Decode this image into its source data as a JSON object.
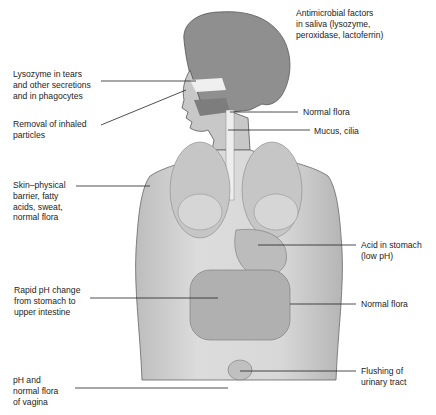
{
  "diagram": {
    "colors": {
      "background": "#ffffff",
      "figure_fill": "#d4d4d4",
      "figure_shade": "#9a9a9a",
      "leader_line": "#222222",
      "text": "#1c1c1c"
    },
    "labels_left": [
      {
        "id": "lysozyme",
        "text": "Lysozyme in tears\nand other secretions\nand in phagocytes"
      },
      {
        "id": "inhaled",
        "text": "Removal of inhaled\nparticles"
      },
      {
        "id": "skin",
        "text": "Skin–physical\nbarrier, fatty\nacids, sweat,\nnormal flora"
      },
      {
        "id": "ph-change",
        "text": "Rapid pH change\nfrom stomach to\nupper intestine"
      },
      {
        "id": "vagina",
        "text": "pH and\nnormal flora\nof vagina"
      }
    ],
    "labels_right": [
      {
        "id": "saliva",
        "text": "Antimicrobial factors\nin saliva (lysozyme,\nperoxidase, lactoferrin)"
      },
      {
        "id": "normal-flora-throat",
        "text": "Normal flora"
      },
      {
        "id": "mucus",
        "text": "Mucus, cilia"
      },
      {
        "id": "acid",
        "text": "Acid in stomach\n(low pH)"
      },
      {
        "id": "normal-flora-gut",
        "text": "Normal flora"
      },
      {
        "id": "urinary",
        "text": "Flushing of\nurinary tract"
      }
    ]
  }
}
